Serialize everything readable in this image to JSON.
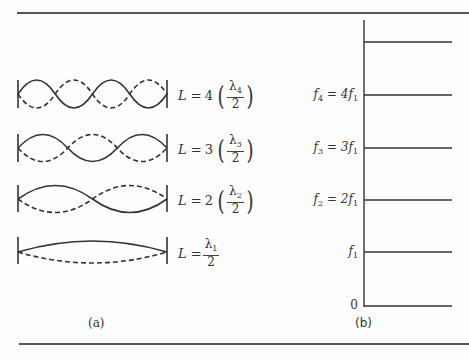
{
  "panel_a": {
    "caption": "(a)",
    "modes": [
      {
        "n": 4,
        "lhs": "L = ",
        "coef": "4",
        "num": "λ",
        "sub": "4",
        "den": "2"
      },
      {
        "n": 3,
        "lhs": "L = ",
        "coef": "3",
        "num": "λ",
        "sub": "3",
        "den": "2"
      },
      {
        "n": 2,
        "lhs": "L = ",
        "coef": "2",
        "num": "λ",
        "sub": "2",
        "den": "2"
      },
      {
        "n": 1,
        "lhs": "L = ",
        "coef": "",
        "num": "λ",
        "sub": "1",
        "den": "2"
      }
    ]
  },
  "panel_b": {
    "caption": "(b)",
    "levels": [
      {
        "label": "f",
        "sub": "4",
        "rhs": " = 4f",
        "rhs_sub": "1"
      },
      {
        "label": "f",
        "sub": "3",
        "rhs": " = 3f",
        "rhs_sub": "1"
      },
      {
        "label": "f",
        "sub": "2",
        "rhs": " = 2f",
        "rhs_sub": "1"
      },
      {
        "label": "f",
        "sub": "1",
        "rhs": "",
        "rhs_sub": ""
      },
      {
        "label": "0",
        "sub": "",
        "rhs": "",
        "rhs_sub": ""
      }
    ]
  }
}
